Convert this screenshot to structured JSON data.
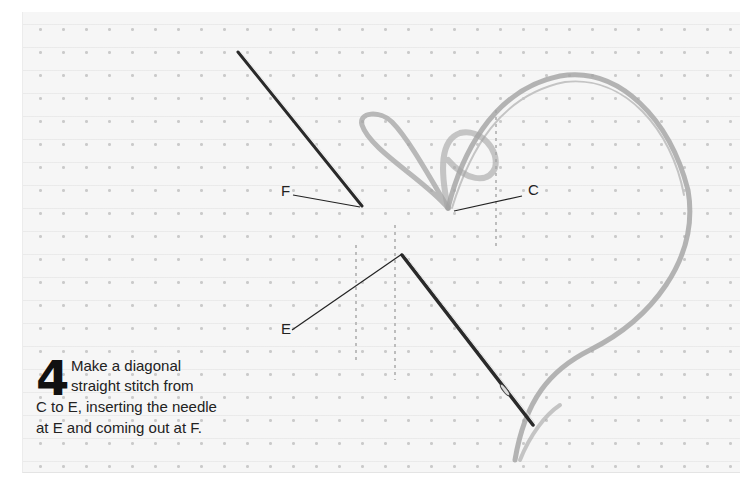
{
  "illustration": {
    "subject": "cross-stitch fabric with needle and thread forming a heart-shaped loop",
    "labels": {
      "F": "F",
      "C": "C",
      "E": "E"
    }
  },
  "caption": {
    "step_number": "4",
    "line1": "Make a diagonal",
    "line2": "straight stitch from",
    "line3": "C to E, inserting the needle",
    "line4": "at E and coming out at F."
  },
  "colors": {
    "fabric": "#f6f6f6",
    "thread": "#9a9a9a",
    "needle": "#2a2a2a",
    "text": "#222222"
  }
}
